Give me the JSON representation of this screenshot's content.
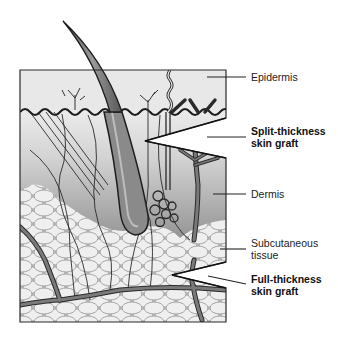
{
  "figure": {
    "labels": {
      "epidermis": "Epidermis",
      "split_line1": "Split-thickness",
      "split_line2": "skin graft",
      "dermis": "Dermis",
      "subq_line1": "Subcutaneous",
      "subq_line2": "tissue",
      "full_line1": "Full-thickness",
      "full_line2": "skin graft"
    },
    "colors": {
      "outline": "#2a2a2a",
      "epidermis_fill": "#e6e6e6",
      "dermis_top": "#d0d0d0",
      "dermis_bottom": "#8a8a8a",
      "fat_cell": "#eeeeee",
      "fat_stroke": "#9a9a9a",
      "vessel": "#6e6e6e",
      "hair": "#7a7a7a"
    }
  }
}
